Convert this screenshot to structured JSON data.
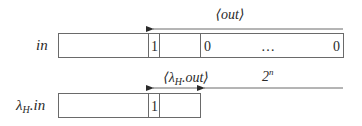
{
  "diagram": {
    "top_row": {
      "label": "in",
      "cells": [
        "",
        "1",
        "",
        "0",
        "…",
        "0"
      ],
      "bit_one": "1",
      "zero_left": "0",
      "ellipsis": "…",
      "zero_right": "0"
    },
    "top_arrow": {
      "label": "⟨out⟩"
    },
    "bottom_row": {
      "label_main": "λ",
      "label_sub": "H",
      "label_suffix": ".in",
      "bit_one": "1"
    },
    "bottom_arrows": {
      "short_label_pre": "⟨λ",
      "short_label_sub": "H",
      "short_label_post": ".out⟩",
      "long_label_base": "2",
      "long_label_exp": "n"
    },
    "colors": {
      "stroke": "#6a6a6a",
      "text": "#2a2a2a",
      "background": "#ffffff"
    }
  }
}
